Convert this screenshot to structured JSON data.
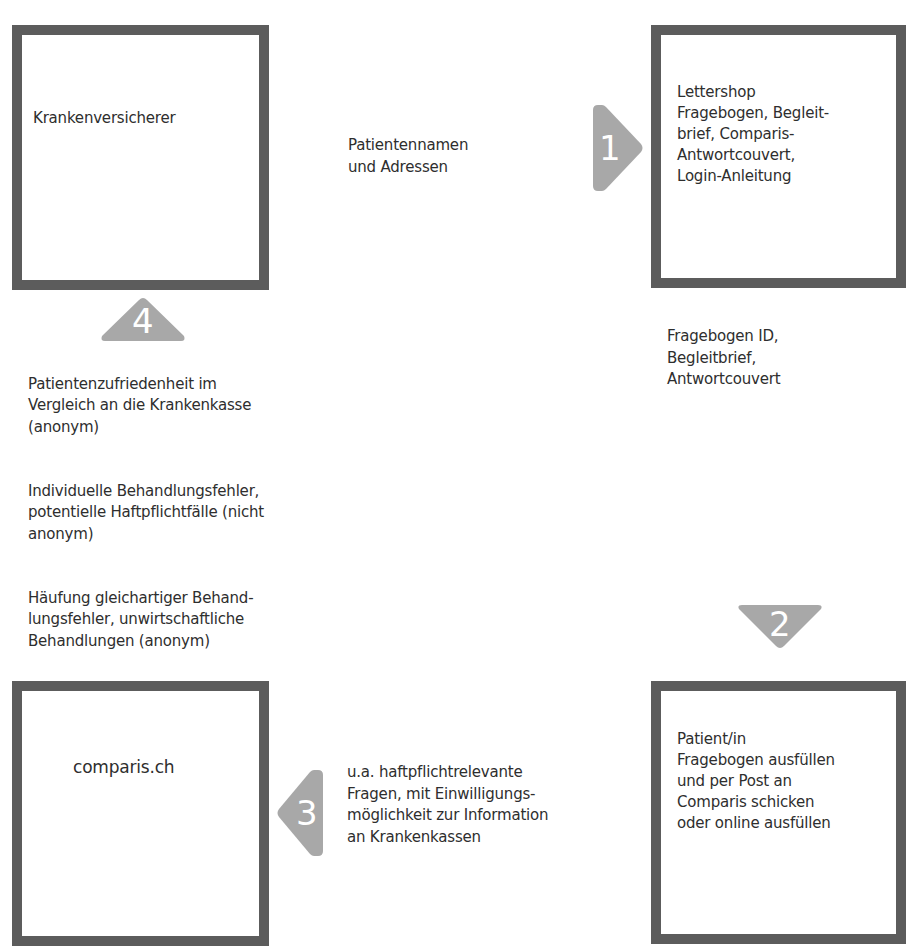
{
  "diagram": {
    "type": "process-flow",
    "colors": {
      "box_border": "#5c5c5c",
      "arrow_fill": "#a8a8a8",
      "arrow_number": "#ffffff",
      "text": "#2e2e2e",
      "background": "#ffffff"
    },
    "nodes": {
      "top_left": {
        "label": "Krankenversicherer"
      },
      "top_right": {
        "label": "Lettershop\nFragebogen, Begleit-\nbrief, Comparis-\nAntwortcouvert,\nLogin-Anleitung"
      },
      "bottom_right": {
        "label": "Patient/in\nFragebogen ausfüllen\nund per Post an\nComparis schicken\noder online ausfüllen"
      },
      "bottom_left": {
        "label": "comparis.ch"
      }
    },
    "steps": [
      {
        "number": "1",
        "direction": "right",
        "from": "Krankenversicherer",
        "to": "Lettershop",
        "description": "Patientennamen\nund Adressen"
      },
      {
        "number": "2",
        "direction": "down",
        "from": "Lettershop",
        "to": "Patient/in",
        "description": "Fragebogen ID,\nBegleitbrief,\nAntwortcouvert"
      },
      {
        "number": "3",
        "direction": "left",
        "from": "Patient/in",
        "to": "comparis.ch",
        "description": "u.a. haftpflichtrelevante\nFragen, mit Einwilligungs-\nmöglichkeit zur Information\nan Krankenkassen"
      },
      {
        "number": "4",
        "direction": "up",
        "from": "comparis.ch",
        "to": "Krankenversicherer",
        "descriptions": [
          "Patientenzufriedenheit im\nVergleich an die Krankenkasse\n(anonym)",
          "Individuelle Behandlungsfehler,\npotentielle Haftpflichtfälle (nicht\nanonym)",
          "Häufung gleichartiger Behand-\nlungsfehler, unwirtschaftliche\nBehandlungen (anonym)"
        ]
      }
    ]
  }
}
